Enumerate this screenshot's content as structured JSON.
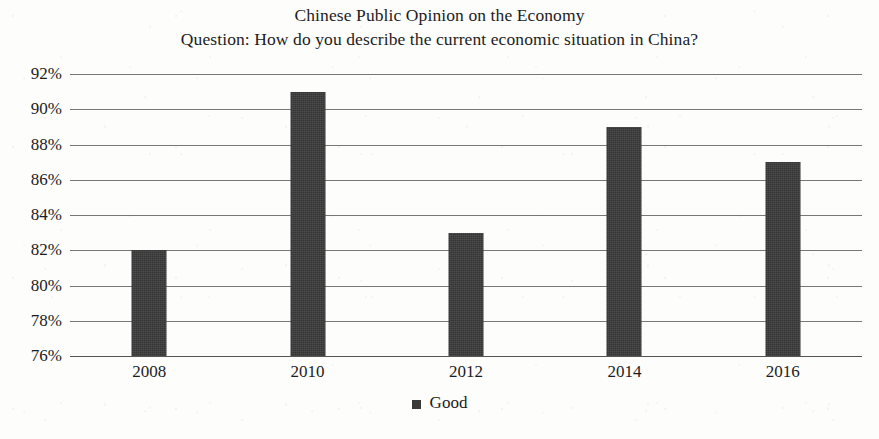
{
  "chart_data": {
    "type": "bar",
    "title": "Chinese Public Opinion on the Economy",
    "subtitle": "Question: How do you describe the current economic situation in China?",
    "categories": [
      "2008",
      "2010",
      "2012",
      "2014",
      "2016"
    ],
    "series": [
      {
        "name": "Good",
        "values": [
          82,
          91,
          83,
          89,
          87
        ],
        "color": "#3a3a3a"
      }
    ],
    "xlabel": "",
    "ylabel": "",
    "ylim": [
      76,
      92
    ],
    "ytick_step": 2,
    "ytick_labels": [
      "92%",
      "90%",
      "88%",
      "86%",
      "84%",
      "82%",
      "80%",
      "78%",
      "76%"
    ],
    "ytick_values": [
      92,
      90,
      88,
      86,
      84,
      82,
      80,
      78,
      76
    ],
    "grid": true,
    "legend_position": "bottom-center",
    "value_suffix": "%"
  },
  "legend": {
    "entries": [
      {
        "label": "Good",
        "color": "#3a3a3a"
      }
    ]
  }
}
